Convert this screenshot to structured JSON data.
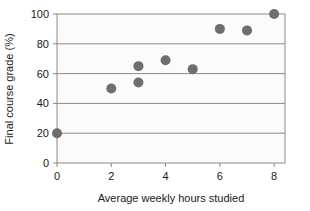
{
  "chart_data": {
    "type": "scatter",
    "title": "",
    "xlabel": "Average weekly hours studied",
    "ylabel": "Final course grade (%)",
    "xlim": [
      0,
      8.4
    ],
    "ylim": [
      0,
      100
    ],
    "xticks": [
      0,
      2,
      4,
      6,
      8
    ],
    "xtick_labels": [
      "0",
      "2",
      "4",
      "6",
      "8"
    ],
    "yticks": [
      0,
      20,
      40,
      60,
      80,
      100
    ],
    "ytick_labels": [
      "0",
      "20",
      "40",
      "60",
      "80",
      "100"
    ],
    "grid": "horizontal",
    "gridlines_y": [
      20,
      40,
      60,
      80
    ],
    "legend": "none",
    "points": [
      {
        "x": 0,
        "y": 20
      },
      {
        "x": 2,
        "y": 50
      },
      {
        "x": 3,
        "y": 65
      },
      {
        "x": 3,
        "y": 54
      },
      {
        "x": 4,
        "y": 69
      },
      {
        "x": 5,
        "y": 63
      },
      {
        "x": 6,
        "y": 90
      },
      {
        "x": 7,
        "y": 89
      },
      {
        "x": 8,
        "y": 100
      }
    ],
    "marker": {
      "shape": "circle",
      "color": "#6e6e6e",
      "size": 5
    },
    "colors": {
      "plot_background": "#fbfbfb",
      "page_background": "#ffffff",
      "frame": "#8a8a8a",
      "gridline": "#8a8a8a",
      "text": "#1a1a1a",
      "marker": "#6e6e6e"
    }
  }
}
